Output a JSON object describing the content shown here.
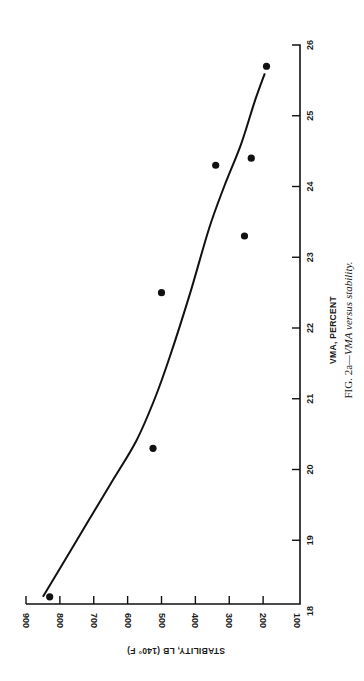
{
  "chart_data": {
    "type": "scatter",
    "orientation": "rotated-90-clockwise",
    "title": "",
    "caption": {
      "label": "FIG. 2a",
      "text": "—VMA versus stability."
    },
    "xlabel": "VMA, PERCENT",
    "ylabel": "STABILITY, LB (140° F)",
    "xlim": [
      18,
      26
    ],
    "ylim": [
      100,
      900
    ],
    "x_ticks": [
      "18",
      "19",
      "20",
      "21",
      "22",
      "23",
      "24",
      "25",
      "26"
    ],
    "y_ticks": [
      "100",
      "200",
      "300",
      "400",
      "500",
      "600",
      "700",
      "800",
      "900"
    ],
    "grid": false,
    "legend": null,
    "series": [
      {
        "name": "Measured",
        "kind": "scatter",
        "points": [
          {
            "x": 18.2,
            "y": 830
          },
          {
            "x": 20.3,
            "y": 525
          },
          {
            "x": 22.5,
            "y": 500
          },
          {
            "x": 23.3,
            "y": 255
          },
          {
            "x": 24.3,
            "y": 340
          },
          {
            "x": 24.4,
            "y": 235
          },
          {
            "x": 25.7,
            "y": 190
          }
        ]
      },
      {
        "name": "Fitted curve",
        "kind": "line",
        "points": [
          {
            "x": 18.2,
            "y": 850
          },
          {
            "x": 19.0,
            "y": 750
          },
          {
            "x": 19.8,
            "y": 650
          },
          {
            "x": 20.4,
            "y": 575
          },
          {
            "x": 21.0,
            "y": 520
          },
          {
            "x": 21.6,
            "y": 475
          },
          {
            "x": 22.5,
            "y": 415
          },
          {
            "x": 23.4,
            "y": 360
          },
          {
            "x": 24.0,
            "y": 315
          },
          {
            "x": 24.6,
            "y": 265
          },
          {
            "x": 25.2,
            "y": 225
          },
          {
            "x": 25.6,
            "y": 195
          }
        ]
      }
    ]
  }
}
